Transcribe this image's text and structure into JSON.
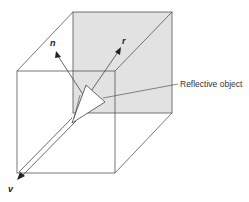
{
  "diagram": {
    "labels": {
      "normal": "n",
      "reflected": "r",
      "view": "v",
      "object_callout": "Reflective object"
    },
    "colors": {
      "line": "#555555",
      "shaded_face": "#e2e2e2",
      "arrow": "#222222",
      "object_fill": "#ffffff"
    }
  }
}
